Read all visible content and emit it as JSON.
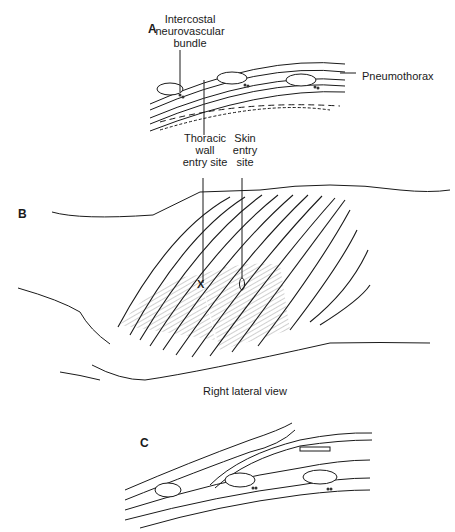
{
  "panels": {
    "a": {
      "letter": "A"
    },
    "b": {
      "letter": "B",
      "caption": "Right lateral view"
    },
    "c": {
      "letter": "C"
    }
  },
  "labels": {
    "neurovascular": [
      "Intercostal",
      "neurovascular",
      "bundle"
    ],
    "pneumothorax": "Pneumothorax",
    "thoracic_wall": [
      "Thoracic",
      "wall",
      "entry site"
    ],
    "skin_entry": [
      "Skin",
      "entry",
      "site"
    ],
    "entry_mark": "X"
  },
  "colors": {
    "ink": "#1a1a1a",
    "hatch": "#555555",
    "background": "#ffffff"
  }
}
